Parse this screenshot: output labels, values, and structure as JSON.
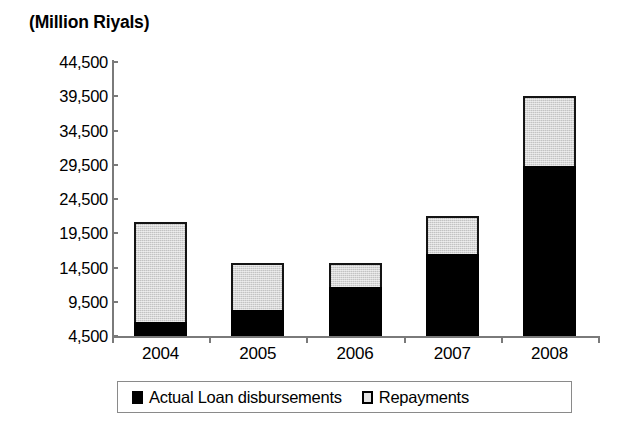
{
  "chart_data": {
    "type": "bar",
    "subtype": "stacked-vertical",
    "title": "(Million Riyals)",
    "xlabel": "",
    "ylabel": "",
    "categories": [
      "2004",
      "2005",
      "2006",
      "2007",
      "2008"
    ],
    "series": [
      {
        "name": "Actual Loan disbursements",
        "color": "#000000",
        "marker": "filled-square",
        "values": [
          6500,
          8300,
          11700,
          16500,
          29300
        ]
      },
      {
        "name": "Repayments",
        "color": "#d7d7d7",
        "marker": "outlined-square",
        "values": [
          21200,
          15200,
          15200,
          22000,
          39500
        ]
      }
    ],
    "stack_note": "Series values are cumulative tops read off the axis; bars are drawn from the axis base of 4,500.",
    "ylim": [
      4500,
      44500
    ],
    "y_base": 4500,
    "yticks": [
      4500,
      9500,
      14500,
      19500,
      24500,
      29500,
      34500,
      39500,
      44500
    ],
    "ytick_labels": [
      "4,500",
      "9,500",
      "14,500",
      "19,500",
      "24,500",
      "29,500",
      "34,500",
      "39,500",
      "44,500"
    ],
    "grid": false,
    "legend_position": "bottom",
    "legend_entries": [
      "Actual Loan disbursements",
      "Repayments"
    ]
  },
  "axis": {
    "y_labels": [
      "44,500",
      "39,500",
      "34,500",
      "29,500",
      "24,500",
      "19,500",
      "14,500",
      "9,500",
      "4,500"
    ],
    "x_labels": [
      "2004",
      "2005",
      "2006",
      "2007",
      "2008"
    ]
  },
  "legend": {
    "items": [
      {
        "label": "Actual Loan disbursements",
        "swatch": "filled-square-icon"
      },
      {
        "label": "Repayments",
        "swatch": "outlined-square-icon"
      }
    ]
  },
  "colors": {
    "disbursements": "#000000",
    "repayments": "#d7d7d7",
    "axis": "#7a7a7a",
    "outline": "#141414",
    "background": "#ffffff"
  }
}
